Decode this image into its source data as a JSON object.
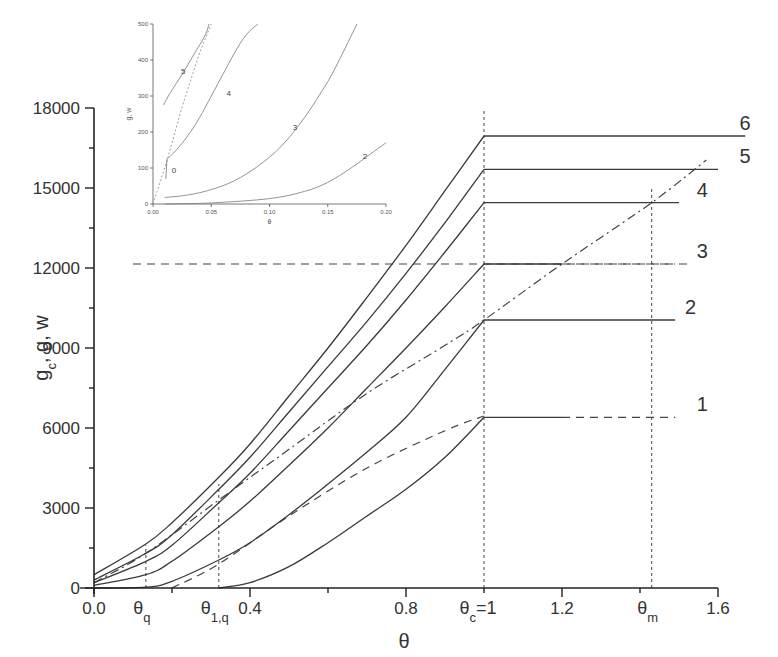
{
  "chart_data": {
    "type": "line",
    "title": "",
    "xlabel": "θ",
    "ylabel": "g_c, g, w",
    "xlim": [
      0.0,
      1.6
    ],
    "ylim": [
      0,
      18000
    ],
    "grid": false,
    "x_ticks": [
      {
        "value": 0.0,
        "label": "0.0"
      },
      {
        "value": 0.4,
        "label": "0.4"
      },
      {
        "value": 0.8,
        "label": "0.8"
      },
      {
        "value": 1.2,
        "label": "1.2"
      },
      {
        "value": 1.6,
        "label": "1.6"
      }
    ],
    "x_minor_ticks": [
      0.2,
      0.6,
      1.0,
      1.4
    ],
    "x_special_labels": [
      {
        "value": 0.133,
        "main": "θ",
        "sub": "q"
      },
      {
        "value": 0.32,
        "main": "θ",
        "sub": "1,q"
      },
      {
        "value": 1.0,
        "main": "θ",
        "sub": "c",
        "suffix": "=1"
      },
      {
        "value": 1.43,
        "main": "θ",
        "sub": "m"
      }
    ],
    "y_ticks": [
      0,
      3000,
      6000,
      9000,
      12000,
      15000,
      18000
    ],
    "y_minor_ticks": [
      1500,
      4500,
      7500,
      10500,
      13500,
      16500
    ],
    "series": [
      {
        "name": "1",
        "style": "solid",
        "label_end_x": 1.53,
        "points": [
          [
            0.32,
            0
          ],
          [
            0.4,
            200
          ],
          [
            0.5,
            800
          ],
          [
            0.6,
            1700
          ],
          [
            0.7,
            2700
          ],
          [
            0.8,
            3700
          ],
          [
            0.9,
            4900
          ],
          [
            1.0,
            6400
          ]
        ],
        "plateau": {
          "level": 6400,
          "solid_to": 1.2,
          "dashed_to": 1.49
        }
      },
      {
        "name": "2",
        "style": "solid",
        "label_end_x": 1.5,
        "points": [
          [
            0.0,
            0
          ],
          [
            0.133,
            30
          ],
          [
            0.2,
            250
          ],
          [
            0.32,
            1050
          ],
          [
            0.4,
            1700
          ],
          [
            0.5,
            2750
          ],
          [
            0.6,
            3900
          ],
          [
            0.7,
            5100
          ],
          [
            0.8,
            6400
          ],
          [
            0.9,
            8200
          ],
          [
            1.0,
            10050
          ]
        ],
        "plateau": {
          "level": 10050,
          "solid_to": 1.49,
          "dashed_to": null
        }
      },
      {
        "name": "3",
        "style": "solid",
        "label_end_x": 1.53,
        "points": [
          [
            0.0,
            100
          ],
          [
            0.133,
            500
          ],
          [
            0.2,
            1000
          ],
          [
            0.32,
            2300
          ],
          [
            0.4,
            3250
          ],
          [
            0.5,
            4600
          ],
          [
            0.6,
            6000
          ],
          [
            0.7,
            7500
          ],
          [
            0.8,
            9000
          ],
          [
            0.9,
            10550
          ],
          [
            1.0,
            12150
          ]
        ],
        "plateau": {
          "level": 12150,
          "solid_to": 1.2,
          "dashed_to": 1.49
        }
      },
      {
        "name": "4",
        "style": "solid",
        "label_end_x": 1.53,
        "points": [
          [
            0.0,
            200
          ],
          [
            0.133,
            1000
          ],
          [
            0.2,
            1600
          ],
          [
            0.32,
            3200
          ],
          [
            0.4,
            4300
          ],
          [
            0.5,
            5900
          ],
          [
            0.6,
            7500
          ],
          [
            0.7,
            9100
          ],
          [
            0.8,
            10800
          ],
          [
            0.9,
            12600
          ],
          [
            1.0,
            14450
          ]
        ],
        "plateau": {
          "level": 14450,
          "solid_to": 1.5,
          "dashed_to": null
        }
      },
      {
        "name": "5",
        "style": "solid",
        "label_end_x": 1.64,
        "points": [
          [
            0.0,
            300
          ],
          [
            0.133,
            1300
          ],
          [
            0.2,
            2000
          ],
          [
            0.32,
            3700
          ],
          [
            0.4,
            4900
          ],
          [
            0.5,
            6600
          ],
          [
            0.6,
            8300
          ],
          [
            0.7,
            10000
          ],
          [
            0.8,
            11800
          ],
          [
            0.9,
            13700
          ],
          [
            1.0,
            15700
          ]
        ],
        "plateau": {
          "level": 15700,
          "solid_to": 1.6,
          "dashed_to": null
        }
      },
      {
        "name": "6",
        "style": "solid",
        "label_end_x": 1.64,
        "points": [
          [
            0.0,
            500
          ],
          [
            0.133,
            1650
          ],
          [
            0.2,
            2450
          ],
          [
            0.32,
            4150
          ],
          [
            0.4,
            5400
          ],
          [
            0.5,
            7200
          ],
          [
            0.6,
            9000
          ],
          [
            0.7,
            10900
          ],
          [
            0.8,
            12850
          ],
          [
            0.9,
            14900
          ],
          [
            1.0,
            16950
          ]
        ],
        "plateau": {
          "level": 16950,
          "solid_to": 1.67,
          "dashed_to": null
        }
      }
    ],
    "reference_lines": [
      {
        "name": "dashed-line-1",
        "style": "dashed",
        "points": [
          [
            0.2,
            0
          ],
          [
            0.32,
            900
          ],
          [
            0.5,
            2700
          ],
          [
            0.7,
            4500
          ],
          [
            0.9,
            5900
          ],
          [
            1.0,
            6450
          ]
        ]
      },
      {
        "name": "dash-dot-line",
        "style": "dashdot",
        "points": [
          [
            0.0,
            200
          ],
          [
            0.133,
            1300
          ],
          [
            0.32,
            3300
          ],
          [
            0.5,
            5200
          ],
          [
            0.7,
            7300
          ],
          [
            0.9,
            9100
          ],
          [
            1.0,
            10050
          ],
          [
            1.2,
            12150
          ],
          [
            1.43,
            14450
          ],
          [
            1.57,
            16050
          ]
        ]
      },
      {
        "name": "dashed-line-3",
        "style": "dashed",
        "points": [
          [
            0.1,
            12150
          ],
          [
            1.53,
            12150
          ]
        ]
      }
    ],
    "vertical_markers": [
      {
        "name": "theta-q-marker",
        "x": 0.133,
        "y_top": 1600
      },
      {
        "name": "theta-1q-marker",
        "x": 0.32,
        "y_top": 3900
      },
      {
        "name": "theta-c-marker",
        "x": 1.0,
        "y_top": 18000
      },
      {
        "name": "theta-m-marker",
        "x": 1.43,
        "y_top": 15000
      }
    ],
    "inset": {
      "xlabel": "θ",
      "ylabel": "g, w",
      "xlim": [
        0.0,
        0.2
      ],
      "ylim": [
        0,
        500
      ],
      "x_ticks": [
        "0.00",
        "0.05",
        "0.10",
        "0.15",
        "0.20"
      ],
      "x_tick_values": [
        0.0,
        0.05,
        0.1,
        0.15,
        0.2
      ],
      "y_ticks": [
        0,
        100,
        200,
        300,
        400,
        500
      ],
      "series": [
        {
          "name": "2",
          "label_at": [
            0.18,
            125
          ],
          "points": [
            [
              0.01,
              0
            ],
            [
              0.05,
              3
            ],
            [
              0.1,
              15
            ],
            [
              0.13,
              35
            ],
            [
              0.15,
              60
            ],
            [
              0.17,
              100
            ],
            [
              0.185,
              135
            ],
            [
              0.2,
              170
            ]
          ]
        },
        {
          "name": "3",
          "label_at": [
            0.12,
            205
          ],
          "points": [
            [
              0.01,
              18
            ],
            [
              0.03,
              25
            ],
            [
              0.05,
              40
            ],
            [
              0.07,
              65
            ],
            [
              0.09,
              105
            ],
            [
              0.11,
              160
            ],
            [
              0.13,
              240
            ],
            [
              0.15,
              340
            ],
            [
              0.163,
              420
            ],
            [
              0.175,
              500
            ]
          ]
        },
        {
          "name": "4",
          "label_at": [
            0.063,
            300
          ],
          "points": [
            [
              0.012,
              125
            ],
            [
              0.02,
              150
            ],
            [
              0.03,
              190
            ],
            [
              0.04,
              240
            ],
            [
              0.05,
              300
            ],
            [
              0.06,
              360
            ],
            [
              0.07,
              420
            ],
            [
              0.08,
              470
            ],
            [
              0.09,
              500
            ]
          ]
        },
        {
          "name": "5",
          "label_at": [
            0.024,
            360
          ],
          "points": [
            [
              0.009,
              275
            ],
            [
              0.015,
              310
            ],
            [
              0.025,
              360
            ],
            [
              0.035,
              415
            ],
            [
              0.045,
              470
            ],
            [
              0.048,
              500
            ]
          ]
        }
      ],
      "dashed_line": [
        [
          0.0,
          0
        ],
        [
          0.012,
          120
        ],
        [
          0.025,
          270
        ],
        [
          0.04,
          420
        ],
        [
          0.05,
          500
        ]
      ],
      "annotation": {
        "text": "0",
        "at": [
          0.016,
          85
        ]
      },
      "arrow": {
        "from": [
          0.012,
          125
        ],
        "to": [
          0.011,
          70
        ]
      }
    }
  }
}
